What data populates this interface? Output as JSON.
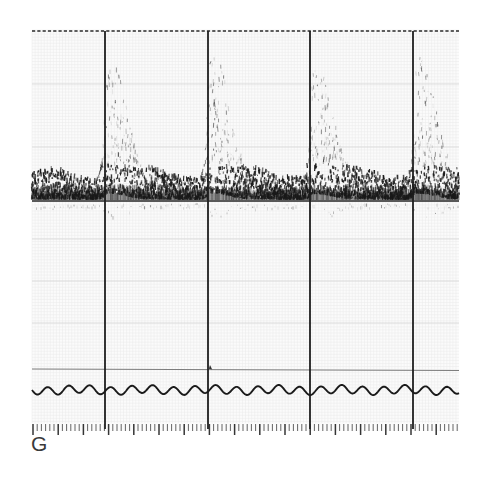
{
  "figure": {
    "panel_label": "G",
    "modality": "spectral-doppler-ultrasound",
    "background_color": "#ffffff",
    "trace_color": "#1a1a1a",
    "grid_color": "#d8d8d8",
    "fine_grid_color": "#ebebeb",
    "frame": {
      "x": 32,
      "y": 29,
      "width": 427,
      "height": 402
    }
  },
  "chart_data": {
    "type": "line",
    "title": "",
    "subtitle": "",
    "xlabel": "",
    "ylabel": "",
    "grid": true,
    "legend_position": "none",
    "xlim": [
      0,
      427
    ],
    "ylim": [
      0,
      402
    ],
    "baseline_y": 201,
    "top_dashed_border_y": 31,
    "lower_solid_line_y": 369,
    "horizontal_gridlines": [
      31,
      84,
      147,
      201,
      239,
      281,
      323,
      369
    ],
    "vertical_time_markers": [
      73,
      176,
      278,
      381
    ],
    "cycle_count": 5,
    "series": [
      {
        "name": "doppler-envelope",
        "note": "systolic peaks above baseline",
        "peaks_x": [
          76,
          179,
          282,
          385,
          456
        ],
        "peak_heights": [
          118,
          122,
          110,
          118,
          120
        ],
        "diastolic_floor": 22
      },
      {
        "name": "mirror-artifact",
        "note": "faint spectral mirror below baseline",
        "amplitude": 14
      },
      {
        "name": "physiologic-wave",
        "note": "low amplitude wavy trace near bottom of panel",
        "baseline_y": 390,
        "amplitude": 4,
        "period": 21
      }
    ],
    "tick_ruler": {
      "y": 424,
      "minor_tick_spacing": 4.2,
      "major_every": 6,
      "minor_height": 7,
      "major_height": 11,
      "count": 102
    }
  }
}
